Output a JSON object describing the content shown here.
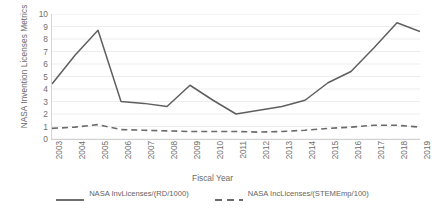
{
  "chart_data": {
    "type": "line",
    "title": "",
    "xlabel": "Fiscal Year",
    "ylabel": "NASA Invention Licenses Metrics",
    "categories": [
      "2003",
      "2004",
      "2005",
      "2006",
      "2007",
      "2008",
      "2009",
      "2010",
      "2011",
      "2012",
      "2013",
      "2014",
      "2015",
      "2016",
      "2017",
      "2018",
      "2019"
    ],
    "x": [
      2003,
      2004,
      2005,
      2006,
      2007,
      2008,
      2009,
      2010,
      2011,
      2012,
      2013,
      2014,
      2015,
      2016,
      2017,
      2018,
      2019
    ],
    "ylim": [
      0,
      10
    ],
    "xlim": [
      2003,
      2019
    ],
    "yticks": [
      0,
      1,
      2,
      3,
      4,
      5,
      6,
      7,
      8,
      9,
      10
    ],
    "grid": true,
    "grid_axis": "y",
    "legend_position": "bottom",
    "series": [
      {
        "name": "NASA InvLicenses/(RD/1000)",
        "style": "solid",
        "color": "#5f5f5f",
        "values": [
          4.4,
          6.7,
          8.7,
          3.0,
          2.85,
          2.6,
          4.3,
          3.1,
          2.0,
          2.3,
          2.6,
          3.1,
          4.5,
          5.4,
          7.3,
          9.3,
          8.6
        ]
      },
      {
        "name": "NASA IncLicenses/(STEMEmp/100)",
        "style": "dashed",
        "color": "#6a6a6a",
        "values": [
          0.85,
          0.95,
          1.15,
          0.75,
          0.7,
          0.65,
          0.6,
          0.6,
          0.6,
          0.55,
          0.6,
          0.7,
          0.85,
          0.95,
          1.1,
          1.1,
          0.95
        ]
      }
    ]
  },
  "legend": {
    "items": [
      {
        "label": "NASA InvLicenses/(RD/1000)"
      },
      {
        "label": "NASA IncLicenses/(STEMEmp/100)"
      }
    ]
  },
  "axes": {
    "x_title": "Fiscal Year",
    "y_title": "NASA Invention Licenses Metrics"
  },
  "colors": {
    "series_solid": "#5f5f5f",
    "series_dashed": "#6a6a6a",
    "grid": "#ededed",
    "axis": "#d0d0d0",
    "text": "#6b6b6b"
  }
}
